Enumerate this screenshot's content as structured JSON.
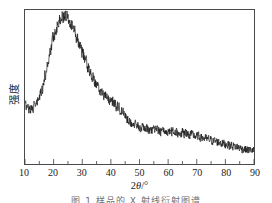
{
  "figure": {
    "caption": "图 1   样品的 X 射线衍射图谱",
    "background_color": "#ffffff",
    "line_color": "#1a1a1a",
    "frame_color": "#4a4a4a"
  },
  "chart_data": {
    "type": "line",
    "title": "",
    "subtitle": "",
    "xlabel": "2θ/°",
    "xlabel_parts": {
      "prefix": "2",
      "italic": "θ",
      "suffix": "/°"
    },
    "ylabel": "强度",
    "xlim": [
      10,
      90
    ],
    "ylim": [
      0,
      100
    ],
    "xticks": [
      10,
      20,
      30,
      40,
      50,
      60,
      70,
      80,
      90
    ],
    "xtick_labels": [
      "10",
      "20",
      "30",
      "40",
      "50",
      "60",
      "70",
      "80",
      "90"
    ],
    "x_minor_tick_interval": 5,
    "yticks": [],
    "ytick_labels": [],
    "grid": false,
    "legend": null,
    "legend_position": "none",
    "annotations": [],
    "series": [
      {
        "name": "XRD intensity",
        "color": "#1a1a1a",
        "line_width": 0.7,
        "noise_amplitude": 5.5,
        "x": [
          10,
          11,
          12,
          13,
          14,
          15,
          16,
          17,
          18,
          19,
          20,
          21,
          22,
          23,
          24,
          25,
          26,
          27,
          28,
          29,
          30,
          31,
          32,
          33,
          34,
          35,
          36,
          37,
          38,
          39,
          40,
          41,
          42,
          43,
          44,
          45,
          46,
          47,
          48,
          49,
          50,
          52,
          54,
          56,
          58,
          60,
          62,
          64,
          66,
          68,
          70,
          72,
          74,
          76,
          78,
          80,
          82,
          84,
          86,
          88,
          90
        ],
        "values": [
          38,
          37,
          36,
          37,
          39,
          43,
          49,
          57,
          66,
          75,
          83,
          89,
          93,
          96,
          97,
          96,
          93,
          88,
          83,
          78,
          73,
          68,
          63,
          59,
          55,
          51,
          48,
          46,
          44,
          42,
          41,
          40,
          38,
          36,
          34,
          31,
          29,
          27,
          26,
          25,
          24,
          23,
          22,
          22,
          21,
          21,
          21,
          20,
          20,
          19,
          18,
          17,
          16,
          15,
          14,
          13,
          12,
          11,
          10,
          9,
          9
        ]
      }
    ]
  },
  "x_tick_label_list": [
    "10",
    "20",
    "30",
    "40",
    "50",
    "60",
    "70",
    "80",
    "90"
  ]
}
